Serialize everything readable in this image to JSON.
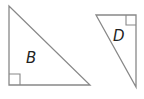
{
  "figure": {
    "shapes": [
      {
        "label": "B",
        "type": "right-triangle",
        "points": [
          [
            9,
            6
          ],
          [
            9,
            85
          ],
          [
            90,
            85
          ]
        ],
        "right_angle_at": [
          9,
          85
        ],
        "label_pos": [
          31,
          62
        ]
      },
      {
        "label": "D",
        "type": "right-triangle",
        "points": [
          [
            96,
            15
          ],
          [
            136,
            15
          ],
          [
            136,
            87
          ]
        ],
        "right_angle_at": [
          136,
          15
        ],
        "label_pos": [
          117,
          40
        ]
      }
    ],
    "stroke_color": "#888888",
    "label_color": "#222222"
  }
}
